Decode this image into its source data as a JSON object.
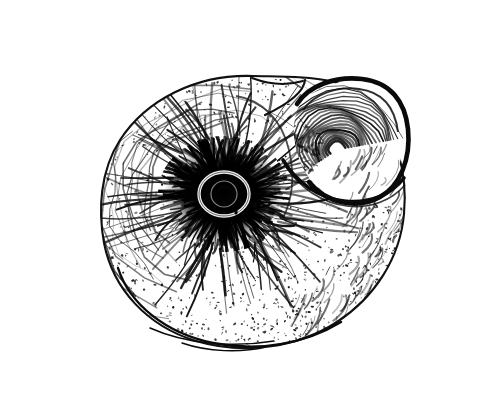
{
  "figure": {
    "domain": "Natural-Image",
    "kind": "scientific-illustration",
    "medium": "pen-and-ink line drawing with stipple and hatching",
    "subject_detail": "planispiral snail shell seen from the side, spire/umbilicus centred, aperture opening toward upper right",
    "caption": "",
    "title": "",
    "label": "",
    "background_color": "#ffffff",
    "ink_color": "#111111",
    "frame": {
      "present": true,
      "color": "#5a5a5a",
      "thickness_px": 1.4,
      "x": 14,
      "y": 14,
      "width": 466,
      "height": 381
    },
    "image_size": {
      "width": 497,
      "height": 405
    }
  },
  "drawing": {
    "shell_outline": {
      "center_x": 253,
      "center_y": 212,
      "left_x": 101,
      "right_x": 406,
      "top_y": 76,
      "bottom_y": 346
    },
    "core": {
      "name": "dark-spiral-core",
      "center_x": 224,
      "center_y": 194,
      "radius": 62,
      "description": "densely inked radial hatching forming the shell spire, with a small pale hook-shaped umbilicus at its middle"
    },
    "umbilicus": {
      "center_x": 224,
      "center_y": 194,
      "radius": 11,
      "description": "tiny light comma/hook shaped opening at the very centre"
    },
    "aperture": {
      "name": "shell-aperture",
      "center_x": 343,
      "center_y": 143,
      "rx": 62,
      "ry": 60,
      "rim_color": "#111111",
      "description": "open mouth of the last whorl at upper right, bounded by a thick dark peristome lip and filled with concentric growth ridges"
    },
    "texture": {
      "radial_hatch_count": 150,
      "stipple_count": 1700,
      "growth_line_count": 26,
      "description": "radiating hatch strokes from the core fading into coarse stipple toward the shell margin; curved growth lines follow the whorl"
    }
  },
  "icons": {
    "shell": "spiral-shell-icon"
  }
}
